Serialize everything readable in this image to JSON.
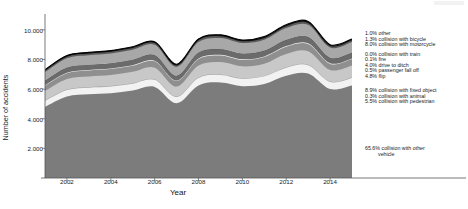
{
  "chart_data": {
    "type": "area",
    "title": "",
    "xlabel": "Year",
    "ylabel": "Number of accidents",
    "xlim": [
      2001,
      2015
    ],
    "ylim": [
      0,
      10800
    ],
    "grid": false,
    "legend_position": "right",
    "stacked": true,
    "x": [
      2001,
      2002,
      2003,
      2004,
      2005,
      2006,
      2007,
      2008,
      2009,
      2010,
      2011,
      2012,
      2013,
      2014,
      2015
    ],
    "xticks": [
      "2002",
      "2004",
      "2006",
      "2008",
      "2010",
      "2012",
      "2014"
    ],
    "yticks": [
      "2.000",
      "4.000",
      "6.000",
      "8.000",
      "10.000"
    ],
    "ytick_values": [
      2000,
      4000,
      6000,
      8000,
      10000
    ],
    "series": [
      {
        "name": "collision with other vehicle",
        "share": "65.6%",
        "color": "#7c7c7c",
        "values": [
          4800,
          5500,
          5650,
          5720,
          5900,
          6150,
          5050,
          6250,
          6450,
          6200,
          6350,
          6900,
          7050,
          6000,
          6250
        ]
      },
      {
        "name": "collision with pedestrian",
        "share": "5.5%",
        "color": "#f2f2f2",
        "values": [
          400,
          440,
          450,
          460,
          470,
          480,
          420,
          500,
          510,
          500,
          510,
          550,
          560,
          480,
          500
        ]
      },
      {
        "name": "collision with animal",
        "share": "0.3%",
        "color": "#9e9e9e",
        "values": [
          25,
          27,
          28,
          28,
          29,
          30,
          26,
          31,
          32,
          31,
          32,
          34,
          35,
          30,
          31
        ]
      },
      {
        "name": "collision with fixed object",
        "share": "8.9%",
        "color": "#c8c8c8",
        "values": [
          650,
          720,
          730,
          745,
          765,
          790,
          680,
          810,
          830,
          805,
          825,
          890,
          910,
          775,
          810
        ]
      },
      {
        "name": "flip",
        "share": "4.8%",
        "color": "#8f8f8f",
        "values": [
          350,
          385,
          395,
          400,
          412,
          425,
          365,
          437,
          448,
          434,
          445,
          480,
          490,
          418,
          437
        ]
      },
      {
        "name": "passenger fall off",
        "share": "0.5%",
        "color": "#efefef",
        "values": [
          37,
          40,
          41,
          42,
          43,
          44,
          38,
          46,
          47,
          45,
          46,
          50,
          51,
          44,
          46
        ]
      },
      {
        "name": "drive to ditch",
        "share": "4.0%",
        "color": "#6b6b6b",
        "values": [
          292,
          321,
          329,
          334,
          343,
          354,
          304,
          364,
          373,
          362,
          371,
          400,
          409,
          348,
          364
        ]
      },
      {
        "name": "fire",
        "share": "0.1%",
        "color": "#454545",
        "values": [
          7,
          8,
          8,
          8,
          9,
          9,
          8,
          9,
          9,
          9,
          9,
          10,
          10,
          9,
          9
        ]
      },
      {
        "name": "collision with train",
        "share": "0.0%",
        "color": "#d8d8d8",
        "values": [
          2,
          2,
          2,
          2,
          2,
          2,
          2,
          2,
          2,
          2,
          2,
          3,
          3,
          2,
          2
        ]
      },
      {
        "name": "collision with motorcycle",
        "share": "8.0%",
        "color": "#a8a8a8",
        "values": [
          585,
          643,
          659,
          669,
          687,
          708,
          608,
          729,
          747,
          724,
          742,
          801,
          818,
          696,
          729
        ]
      },
      {
        "name": "collision with bicycle",
        "share": "1.3%",
        "color": "#5a5a5a",
        "values": [
          95,
          104,
          107,
          109,
          112,
          115,
          99,
          118,
          121,
          118,
          121,
          130,
          133,
          113,
          118
        ]
      },
      {
        "name": "other",
        "share": "1.0%",
        "color": "#111111",
        "values": [
          73,
          80,
          82,
          84,
          86,
          89,
          76,
          91,
          93,
          90,
          93,
          100,
          102,
          87,
          91
        ]
      }
    ],
    "legend_entries": [
      {
        "share": "1.0%",
        "label": "other"
      },
      {
        "share": "1.3%",
        "label": "collision with bicycle"
      },
      {
        "share": "8.0%",
        "label": "collision with motorcycle"
      },
      {
        "share": "0.0%",
        "label": "collision with train"
      },
      {
        "share": "0.1%",
        "label": "fire"
      },
      {
        "share": "4.0%",
        "label": "drive to ditch"
      },
      {
        "share": "0.5%",
        "label": "passenger fall off"
      },
      {
        "share": "4.8%",
        "label": "flip"
      },
      {
        "share": "8.9%",
        "label": "collision with fixed object"
      },
      {
        "share": "0.3%",
        "label": "collision with animal"
      },
      {
        "share": "5.5%",
        "label": "collision with pedestrian"
      },
      {
        "share": "65.6%",
        "label": "collision with other",
        "label2": "vehicle"
      }
    ]
  }
}
